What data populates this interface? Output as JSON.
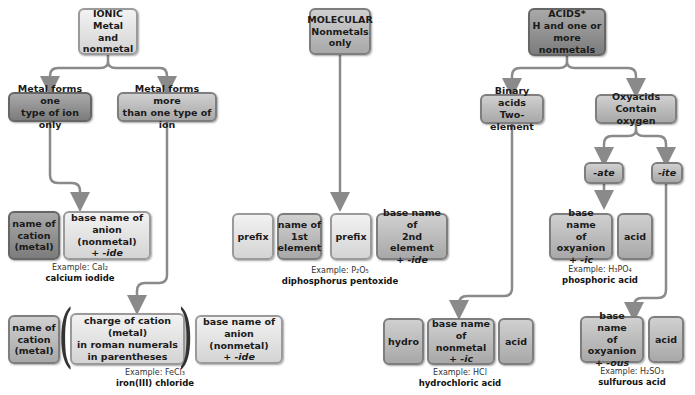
{
  "diagram": {
    "ionic": {
      "header": "IONIC\nMetal and\nnonmetal",
      "branch_one": "Metal forms one\ntype of ion only",
      "branch_more": "Metal forms more\nthan one type of ion",
      "one_cation": "name of\ncation\n(metal)",
      "one_anion": "base name of\nanion (nonmetal)",
      "one_anion_suffix": "+ -ide",
      "one_example_formula": "Example: CaI₂",
      "one_example_name": "calcium iodide",
      "more_cation": "name of\ncation\n(metal)",
      "more_charge": "charge of cation (metal)\nin roman numerals\nin parentheses",
      "more_anion": "base name of\nanion (nonmetal)",
      "more_anion_suffix": "+ -ide",
      "more_example_formula": "Example: FeCl₃",
      "more_example_name": "iron(III) chloride"
    },
    "molecular": {
      "header": "MOLECULAR\nNonmetals\nonly",
      "prefix1": "prefix",
      "first_element": "name of\n1st\nelement",
      "prefix2": "prefix",
      "second_element": "base name of\n2nd element",
      "second_suffix": "+ -ide",
      "example_formula": "Example: P₂O₅",
      "example_name": "diphosphorus pentoxide"
    },
    "acids": {
      "header": "ACIDS*\nH and one or\nmore nonmetals",
      "binary": "Binary acids\nTwo-element",
      "oxy": "Oxyacids\nContain oxygen",
      "ate": "-ate",
      "ite": "-ite",
      "ate_base": "base name\nof oxyanion",
      "ate_suffix": "+ -ic",
      "ate_acid": "acid",
      "ate_example_formula": "Example: H₃PO₄",
      "ate_example_name": "phosphoric acid",
      "binary_hydro": "hydro",
      "binary_base": "base name\nof nonmetal",
      "binary_suffix": "+ -ic",
      "binary_acid": "acid",
      "binary_example_formula": "Example: HCl",
      "binary_example_name": "hydrochloric acid",
      "ite_base": "base name\nof oxyanion",
      "ite_suffix": "+ -ous",
      "ite_acid": "acid",
      "ite_example_formula": "Example: H₂SO₃",
      "ite_example_name": "sulfurous acid"
    },
    "colors": {
      "line": "#8a8a8a",
      "light": "#e6e6e6",
      "mid": "#bdbdbd",
      "dark": "#8e8e8e"
    }
  }
}
